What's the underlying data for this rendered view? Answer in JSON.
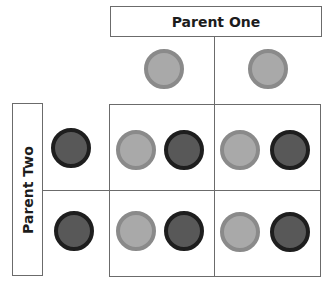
{
  "parent_one": {
    "label": "Parent One",
    "alleles": [
      "light",
      "light"
    ]
  },
  "parent_two": {
    "label": "Parent Two",
    "alleles": [
      "dark",
      "dark"
    ]
  },
  "grid": {
    "rows": [
      {
        "cells": [
          [
            "light",
            "dark"
          ],
          [
            "light",
            "dark"
          ]
        ]
      },
      {
        "cells": [
          [
            "light",
            "dark"
          ],
          [
            "light",
            "dark"
          ]
        ]
      }
    ]
  },
  "colors": {
    "light_fill": "#a9a9a9",
    "light_border": "#8a8a8a",
    "dark_fill": "#585858",
    "dark_border": "#1e1e1e",
    "line": "#6b6b6b"
  }
}
